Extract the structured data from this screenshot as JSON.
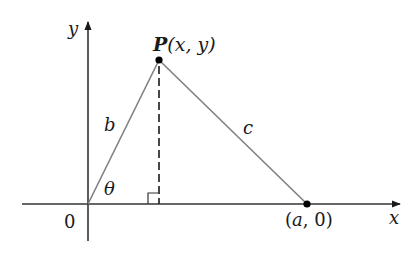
{
  "diagram": {
    "type": "geometry",
    "axes": {
      "x_label": "x",
      "y_label": "y",
      "origin_label": "0"
    },
    "points": {
      "P": {
        "name": "P",
        "coords": "(x, y)",
        "full_label": "P(x, y)"
      },
      "A": {
        "label": "(a, 0)"
      }
    },
    "sides": {
      "b": "b",
      "c": "c"
    },
    "angle": {
      "theta": "θ"
    },
    "label_parts": {
      "p_name": "P",
      "p_coords": "(x, y)",
      "a_var": "a",
      "a_rest": ", 0)",
      "a_open": "("
    },
    "colors": {
      "axis": "#333333",
      "side": "#808080",
      "altitude": "#333333",
      "point": "#000000"
    }
  }
}
